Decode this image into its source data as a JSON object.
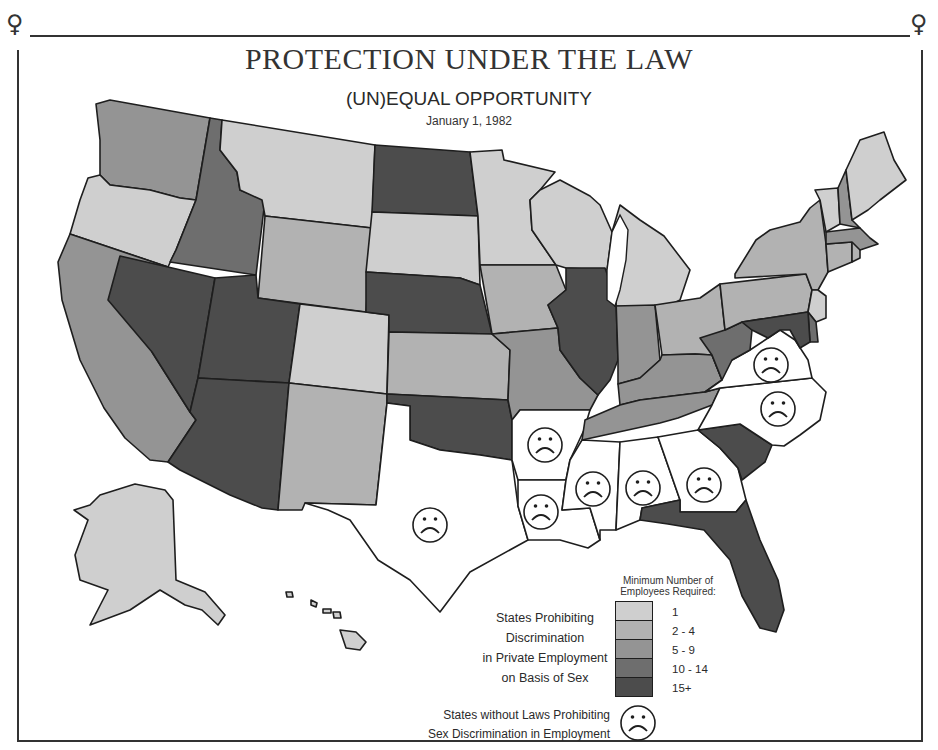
{
  "header": {
    "title": "PROTECTION UNDER THE LAW",
    "subtitle": "(UN)EQUAL OPPORTUNITY",
    "date": "January 1, 1982"
  },
  "decorations": {
    "corner_symbol": "♀"
  },
  "legend": {
    "heading_line1": "Minimum Number of",
    "heading_line2": "Employees Required:",
    "description": [
      "States Prohibiting",
      "Discrimination",
      "in Private Employment",
      "on Basis of Sex"
    ],
    "categories": [
      {
        "label": "1",
        "color": "#cfcfcf"
      },
      {
        "label": "2 - 4",
        "color": "#b2b2b2"
      },
      {
        "label": "5 - 9",
        "color": "#949494"
      },
      {
        "label": "10 - 14",
        "color": "#6e6e6e"
      },
      {
        "label": "15+",
        "color": "#4c4c4c"
      }
    ],
    "no_law": {
      "line1": "States without Laws Prohibiting",
      "line2": "Sex Discrimination in Employment",
      "icon": "frown-face-icon",
      "color": "#ffffff"
    }
  },
  "chart_data": {
    "type": "choropleth",
    "title": "PROTECTION UNDER THE LAW",
    "subtitle": "(UN)EQUAL OPPORTUNITY",
    "date": "January 1, 1982",
    "legend_title": "Minimum Number of Employees Required:",
    "categories": [
      "1",
      "2 - 4",
      "5 - 9",
      "10 - 14",
      "15+",
      "No law"
    ],
    "states": {
      "WA": "5 - 9",
      "OR": "1",
      "CA": "5 - 9",
      "NV": "15+",
      "ID": "10 - 14",
      "MT": "1",
      "WY": "2 - 4",
      "UT": "15+",
      "AZ": "15+",
      "CO": "1",
      "NM": "2 - 4",
      "ND": "15+",
      "SD": "1",
      "NE": "15+",
      "KS": "2 - 4",
      "OK": "15+",
      "TX": "No law",
      "MN": "1",
      "IA": "2 - 4",
      "MO": "5 - 9",
      "AR": "No law",
      "LA": "No law",
      "WI": "1",
      "IL": "15+",
      "MI": "1",
      "IN": "5 - 9",
      "OH": "2 - 4",
      "KY": "5 - 9",
      "TN": "5 - 9",
      "MS": "No law",
      "AL": "No law",
      "GA": "No law",
      "FL": "15+",
      "SC": "15+",
      "NC": "No law",
      "VA": "No law",
      "WV": "10 - 14",
      "PA": "2 - 4",
      "NY": "2 - 4",
      "NJ": "1",
      "DE": "10 - 14",
      "MD": "15+",
      "CT": "2 - 4",
      "RI": "2 - 4",
      "MA": "5 - 9",
      "VT": "1",
      "NH": "5 - 9",
      "ME": "1",
      "AK": "1",
      "HI": "1"
    }
  }
}
